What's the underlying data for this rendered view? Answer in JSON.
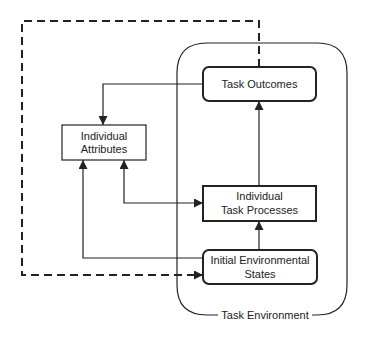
{
  "diagram": {
    "colors": {
      "stroke": "#222222",
      "background": "#ffffff"
    },
    "container": {
      "label": "Task Environment"
    },
    "nodes": {
      "task_outcomes": {
        "lines": [
          "Task Outcomes"
        ]
      },
      "individual_attributes": {
        "lines": [
          "Individual",
          "Attributes"
        ]
      },
      "individual_task_processes": {
        "lines": [
          "Individual",
          "Task Processes"
        ]
      },
      "initial_environmental_states": {
        "lines": [
          "Initial Environmental",
          "States"
        ]
      }
    },
    "edges": [
      {
        "from": "Task Outcomes",
        "to": "Individual Attributes",
        "style": "solid"
      },
      {
        "from": "Individual Attributes",
        "to": "Individual Task Processes",
        "style": "solid",
        "bidirectional": true
      },
      {
        "from": "Initial Environmental States",
        "to": "Individual Attributes",
        "style": "solid"
      },
      {
        "from": "Initial Environmental States",
        "to": "Individual Task Processes",
        "style": "solid"
      },
      {
        "from": "Individual Task Processes",
        "to": "Task Outcomes",
        "style": "solid"
      },
      {
        "from": "Task Outcomes",
        "to": "Initial Environmental States",
        "style": "dashed"
      }
    ]
  }
}
